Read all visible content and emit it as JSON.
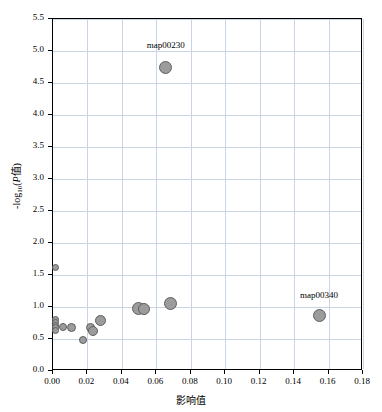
{
  "chart_data": {
    "type": "scatter",
    "title": "",
    "xlabel": "影响值",
    "ylabel_parts": {
      "prefix": "-log",
      "sub": "10",
      "italic": "P",
      "suffix": "值"
    },
    "ylabel": "-log10(P值)",
    "xlim": [
      0.0,
      0.18
    ],
    "ylim": [
      0.0,
      5.5
    ],
    "xticks": [
      "0.00",
      "0.02",
      "0.04",
      "0.06",
      "0.08",
      "0.10",
      "0.12",
      "0.14",
      "0.16",
      "0.18"
    ],
    "xtick_values": [
      0.0,
      0.02,
      0.04,
      0.06,
      0.08,
      0.1,
      0.12,
      0.14,
      0.16,
      0.18
    ],
    "yticks": [
      "0.0",
      "0.5",
      "1.0",
      "1.5",
      "2.0",
      "2.5",
      "3.0",
      "3.5",
      "4.0",
      "4.5",
      "5.0",
      "5.5"
    ],
    "ytick_values": [
      0.0,
      0.5,
      1.0,
      1.5,
      2.0,
      2.5,
      3.0,
      3.5,
      4.0,
      4.5,
      5.0,
      5.5
    ],
    "grid": true,
    "legend": "none",
    "point_color": "#9c9c9c",
    "point_edge_color": "#5f5f5f",
    "grid_color": "#c9d4e4",
    "points": [
      {
        "x": 0.0015,
        "y": 1.61,
        "size": 7,
        "label": ""
      },
      {
        "x": 0.0015,
        "y": 0.8,
        "size": 7,
        "label": ""
      },
      {
        "x": 0.0015,
        "y": 0.755,
        "size": 7,
        "label": ""
      },
      {
        "x": 0.0015,
        "y": 0.715,
        "size": 7,
        "label": ""
      },
      {
        "x": 0.0015,
        "y": 0.675,
        "size": 7,
        "label": ""
      },
      {
        "x": 0.0015,
        "y": 0.635,
        "size": 7,
        "label": ""
      },
      {
        "x": 0.006,
        "y": 0.685,
        "size": 8,
        "label": ""
      },
      {
        "x": 0.0105,
        "y": 0.675,
        "size": 9,
        "label": ""
      },
      {
        "x": 0.0175,
        "y": 0.49,
        "size": 8,
        "label": ""
      },
      {
        "x": 0.0215,
        "y": 0.675,
        "size": 9,
        "label": ""
      },
      {
        "x": 0.0235,
        "y": 0.63,
        "size": 10,
        "label": ""
      },
      {
        "x": 0.0275,
        "y": 0.79,
        "size": 11,
        "label": ""
      },
      {
        "x": 0.0495,
        "y": 0.98,
        "size": 13,
        "label": ""
      },
      {
        "x": 0.053,
        "y": 0.97,
        "size": 12,
        "label": ""
      },
      {
        "x": 0.068,
        "y": 1.06,
        "size": 13,
        "label": ""
      },
      {
        "x": 0.0655,
        "y": 4.74,
        "size": 13,
        "label": "map00230"
      },
      {
        "x": 0.1545,
        "y": 0.86,
        "size": 13,
        "label": "map00340"
      }
    ],
    "annotations": [
      {
        "text": "map00230",
        "x": 0.0655,
        "y": 4.74,
        "dx": 0,
        "dy": 22,
        "anchor": "center"
      },
      {
        "text": "map00340",
        "x": 0.1545,
        "y": 0.86,
        "dx": 0,
        "dy": 20,
        "anchor": "center"
      }
    ]
  }
}
